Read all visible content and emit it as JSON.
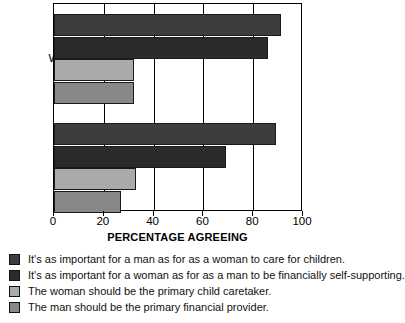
{
  "chart_data": {
    "type": "bar",
    "orientation": "horizontal",
    "title": "",
    "xlabel": "PERCENTAGE AGREEING",
    "ylabel": "",
    "xlim": [
      0,
      100
    ],
    "xticks": [
      0,
      20,
      40,
      60,
      80,
      100
    ],
    "xtick_labels": [
      "0",
      "20",
      "40",
      "60",
      "80",
      "100"
    ],
    "grid": true,
    "grid_axis": "x",
    "legend_position": "below",
    "categories": [
      "Women",
      "Men"
    ],
    "series": [
      {
        "name": "It's as important for a man as for as a woman to care for children.",
        "color": "#3d3d3d",
        "values": [
          91,
          89
        ]
      },
      {
        "name": "It's as important for a woman as for as a man to be financially self-supporting.",
        "color": "#2b2b2b",
        "values": [
          86,
          69
        ]
      },
      {
        "name": "The woman should be the primary child caretaker.",
        "color": "#aaaaaa",
        "values": [
          32,
          33
        ]
      },
      {
        "name": "The man should be the primary financial provider.",
        "color": "#888888",
        "values": [
          32,
          27
        ]
      }
    ]
  },
  "axis": {
    "title": "PERCENTAGE AGREEING",
    "ticks": [
      {
        "label": "0"
      },
      {
        "label": "20"
      },
      {
        "label": "40"
      },
      {
        "label": "60"
      },
      {
        "label": "80"
      },
      {
        "label": "100"
      }
    ]
  },
  "categories": [
    {
      "label": "Women"
    },
    {
      "label": "Men"
    }
  ],
  "legend": {
    "items": [
      {
        "label": "It's as important for a man as for as a woman to care for children.",
        "color": "#3d3d3d"
      },
      {
        "label": "It's as important for a woman as for as a man to be financially self-supporting.",
        "color": "#2b2b2b"
      },
      {
        "label": "The woman should be the primary child caretaker.",
        "color": "#aaaaaa"
      },
      {
        "label": "The man should be the primary financial provider.",
        "color": "#888888"
      }
    ]
  }
}
